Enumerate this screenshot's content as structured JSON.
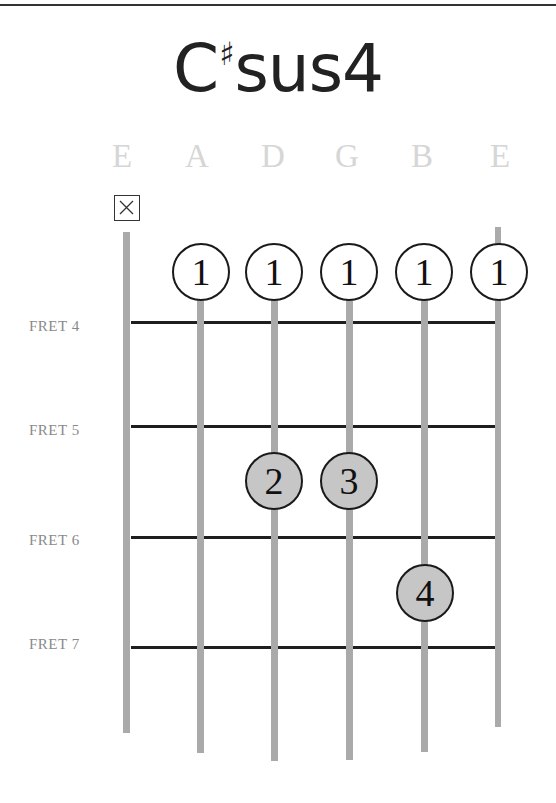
{
  "chord": {
    "root": "C",
    "accidental": "♯",
    "quality": "sus4",
    "full_name": "C♯sus4"
  },
  "strings": [
    {
      "name": "E",
      "x": 127,
      "top": 232,
      "bottom": 733,
      "muted": true
    },
    {
      "name": "A",
      "x": 201,
      "top": 272,
      "bottom": 753,
      "muted": false
    },
    {
      "name": "D",
      "x": 274,
      "top": 272,
      "bottom": 761,
      "muted": false
    },
    {
      "name": "G",
      "x": 349,
      "top": 272,
      "bottom": 760,
      "muted": false
    },
    {
      "name": "B",
      "x": 424,
      "top": 272,
      "bottom": 752,
      "muted": false
    },
    {
      "name": "E",
      "x": 499,
      "top": 227,
      "bottom": 728,
      "muted": false
    }
  ],
  "frets": [
    {
      "label": "FRET 4",
      "y": 322
    },
    {
      "label": "FRET 5",
      "y": 426
    },
    {
      "label": "FRET 6",
      "y": 537
    },
    {
      "label": "FRET 7",
      "y": 647
    }
  ],
  "fingers": [
    {
      "finger": "1",
      "string": "A",
      "x": 201,
      "y": 272,
      "style": "open-bar"
    },
    {
      "finger": "1",
      "string": "D",
      "x": 274,
      "y": 272,
      "style": "open-bar"
    },
    {
      "finger": "1",
      "string": "G",
      "x": 349,
      "y": 272,
      "style": "open-bar"
    },
    {
      "finger": "1",
      "string": "B",
      "x": 424,
      "y": 272,
      "style": "open-bar"
    },
    {
      "finger": "1",
      "string": "E",
      "x": 499,
      "y": 272,
      "style": "open-bar"
    },
    {
      "finger": "2",
      "string": "D",
      "x": 274,
      "y": 481,
      "style": "fretted"
    },
    {
      "finger": "3",
      "string": "G",
      "x": 349,
      "y": 481,
      "style": "fretted"
    },
    {
      "finger": "4",
      "string": "B",
      "x": 425,
      "y": 593,
      "style": "fretted"
    }
  ],
  "muted_marker": {
    "string": "E",
    "icon": "x-box-icon"
  },
  "colors": {
    "string": "#aaaaaa",
    "fret": "#1e1e1e",
    "fretted_dot": "#c6c6c6",
    "string_name": "#d6d6d6",
    "fret_label": "#8a8a8a"
  }
}
